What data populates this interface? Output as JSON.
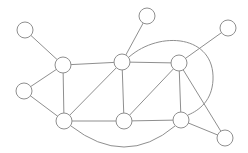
{
  "diagram": {
    "type": "undirected-graph",
    "colors": {
      "stroke": "#8f8f8f",
      "node_fill": "#ffffff",
      "background": "#ffffff"
    },
    "node_radius": 8,
    "nodes": [
      {
        "id": "n1",
        "x": 25,
        "y": 30
      },
      {
        "id": "n2",
        "x": 63,
        "y": 65
      },
      {
        "id": "n3",
        "x": 122,
        "y": 62
      },
      {
        "id": "n4",
        "x": 147,
        "y": 16
      },
      {
        "id": "n5",
        "x": 179,
        "y": 63
      },
      {
        "id": "n6",
        "x": 228,
        "y": 28
      },
      {
        "id": "n7",
        "x": 24,
        "y": 91
      },
      {
        "id": "n8",
        "x": 64,
        "y": 121
      },
      {
        "id": "n9",
        "x": 124,
        "y": 121
      },
      {
        "id": "n10",
        "x": 181,
        "y": 120
      },
      {
        "id": "n11",
        "x": 225,
        "y": 138
      }
    ],
    "edges": [
      {
        "from": "n1",
        "to": "n2"
      },
      {
        "from": "n2",
        "to": "n3"
      },
      {
        "from": "n2",
        "to": "n7"
      },
      {
        "from": "n2",
        "to": "n8"
      },
      {
        "from": "n3",
        "to": "n4"
      },
      {
        "from": "n3",
        "to": "n5"
      },
      {
        "from": "n3",
        "to": "n8"
      },
      {
        "from": "n3",
        "to": "n9"
      },
      {
        "from": "n5",
        "to": "n6"
      },
      {
        "from": "n5",
        "to": "n9"
      },
      {
        "from": "n5",
        "to": "n10"
      },
      {
        "from": "n5",
        "to": "n11"
      },
      {
        "from": "n7",
        "to": "n8"
      },
      {
        "from": "n8",
        "to": "n9"
      },
      {
        "from": "n9",
        "to": "n10"
      },
      {
        "from": "n10",
        "to": "n11"
      }
    ],
    "curved_edges": [
      {
        "from": "n8",
        "to": "n10",
        "path": "M 71 126 Q 125 168 175 126"
      },
      {
        "from": "n3",
        "to": "n10",
        "path": "M 129 57 C 160 30, 215 35, 213 80 C 212 100, 200 110, 188 115"
      }
    ]
  }
}
